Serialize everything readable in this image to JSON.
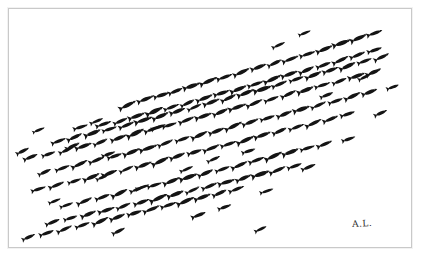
{
  "artwork": {
    "title": "School of Fish",
    "medium": "ink drawing",
    "signature": "A.L.",
    "background_color": "#ffffff",
    "ink_color": "#141414",
    "frame_color": "#c9c9c9",
    "canvas": {
      "width": 425,
      "height": 260
    },
    "frame": {
      "x": 8,
      "y": 8,
      "width": 404,
      "height": 240
    },
    "subject": "fish silhouettes swimming in diagonal rows toward upper right",
    "fish_count": 188,
    "row_angle_degrees": -22
  },
  "chart_data": {
    "type": "scatter",
    "title": "School of Fish",
    "xlabel": "",
    "ylabel": "",
    "xlim": [
      0,
      402
    ],
    "ylim": [
      0,
      238
    ],
    "grid": false,
    "legend": null,
    "marker": "fish-silhouette",
    "series": [
      {
        "name": "row-1",
        "points": [
          [
            119,
            96,
            16
          ],
          [
            137,
            90,
            15
          ],
          [
            153,
            86,
            14
          ],
          [
            167,
            82,
            13
          ],
          [
            183,
            77,
            15
          ],
          [
            200,
            72,
            16
          ],
          [
            216,
            68,
            14
          ],
          [
            233,
            63,
            15
          ],
          [
            250,
            58,
            14
          ],
          [
            266,
            54,
            13
          ],
          [
            282,
            50,
            15
          ],
          [
            299,
            45,
            14
          ],
          [
            316,
            40,
            15
          ],
          [
            333,
            34,
            16
          ],
          [
            350,
            29,
            15
          ],
          [
            366,
            24,
            14
          ]
        ]
      },
      {
        "name": "row-2",
        "points": [
          [
            95,
            115,
            14
          ],
          [
            112,
            112,
            13
          ],
          [
            128,
            107,
            15
          ],
          [
            146,
            102,
            16
          ],
          [
            163,
            98,
            14
          ],
          [
            179,
            94,
            13
          ],
          [
            196,
            89,
            15
          ],
          [
            213,
            84,
            14
          ],
          [
            230,
            80,
            15
          ],
          [
            247,
            75,
            14
          ],
          [
            264,
            70,
            16
          ],
          [
            281,
            65,
            15
          ],
          [
            298,
            61,
            14
          ],
          [
            315,
            56,
            13
          ],
          [
            332,
            51,
            15
          ],
          [
            349,
            46,
            14
          ],
          [
            366,
            41,
            13
          ]
        ]
      },
      {
        "name": "row-3",
        "points": [
          [
            50,
            132,
            13
          ],
          [
            66,
            128,
            14
          ],
          [
            84,
            124,
            15
          ],
          [
            101,
            120,
            13
          ],
          [
            118,
            116,
            14
          ],
          [
            135,
            111,
            16
          ],
          [
            152,
            107,
            15
          ],
          [
            169,
            102,
            14
          ],
          [
            186,
            98,
            13
          ],
          [
            203,
            93,
            15
          ],
          [
            220,
            89,
            14
          ],
          [
            237,
            84,
            15
          ],
          [
            254,
            80,
            16
          ],
          [
            271,
            75,
            14
          ],
          [
            288,
            70,
            13
          ],
          [
            305,
            66,
            15
          ],
          [
            322,
            61,
            14
          ],
          [
            339,
            57,
            15
          ],
          [
            356,
            52,
            13
          ],
          [
            373,
            48,
            14
          ]
        ]
      },
      {
        "name": "row-4",
        "points": [
          [
            22,
            148,
            13
          ],
          [
            40,
            145,
            12
          ],
          [
            58,
            141,
            14
          ],
          [
            75,
            137,
            15
          ],
          [
            92,
            133,
            13
          ],
          [
            110,
            129,
            14
          ],
          [
            127,
            124,
            16
          ],
          [
            144,
            120,
            15
          ],
          [
            161,
            116,
            13
          ],
          [
            178,
            111,
            14
          ],
          [
            195,
            107,
            15
          ],
          [
            212,
            103,
            14
          ],
          [
            229,
            98,
            16
          ],
          [
            246,
            94,
            15
          ],
          [
            263,
            90,
            13
          ],
          [
            280,
            85,
            14
          ],
          [
            297,
            81,
            15
          ],
          [
            314,
            76,
            14
          ],
          [
            331,
            72,
            13
          ],
          [
            348,
            67,
            15
          ],
          [
            365,
            63,
            14
          ]
        ]
      },
      {
        "name": "row-5",
        "points": [
          [
            36,
            163,
            12
          ],
          [
            54,
            159,
            13
          ],
          [
            71,
            155,
            15
          ],
          [
            88,
            151,
            14
          ],
          [
            106,
            147,
            13
          ],
          [
            123,
            143,
            15
          ],
          [
            140,
            139,
            16
          ],
          [
            157,
            134,
            14
          ],
          [
            174,
            130,
            13
          ],
          [
            191,
            126,
            15
          ],
          [
            208,
            122,
            14
          ],
          [
            225,
            117,
            16
          ],
          [
            242,
            113,
            15
          ],
          [
            259,
            109,
            13
          ],
          [
            276,
            105,
            14
          ],
          [
            293,
            100,
            15
          ],
          [
            310,
            96,
            14
          ],
          [
            327,
            92,
            13
          ],
          [
            344,
            87,
            15
          ],
          [
            361,
            83,
            14
          ]
        ]
      },
      {
        "name": "row-6",
        "points": [
          [
            30,
            180,
            13
          ],
          [
            48,
            176,
            14
          ],
          [
            66,
            172,
            12
          ],
          [
            83,
            168,
            15
          ],
          [
            101,
            164,
            14
          ],
          [
            118,
            160,
            13
          ],
          [
            135,
            156,
            15
          ],
          [
            152,
            152,
            16
          ],
          [
            169,
            147,
            14
          ],
          [
            186,
            143,
            13
          ],
          [
            203,
            139,
            15
          ],
          [
            220,
            135,
            14
          ],
          [
            237,
            131,
            16
          ],
          [
            254,
            126,
            15
          ],
          [
            271,
            122,
            13
          ],
          [
            288,
            118,
            14
          ],
          [
            305,
            114,
            15
          ],
          [
            322,
            110,
            14
          ],
          [
            339,
            105,
            13
          ]
        ]
      },
      {
        "name": "row-7",
        "points": [
          [
            58,
            196,
            12
          ],
          [
            76,
            192,
            14
          ],
          [
            94,
            188,
            13
          ],
          [
            111,
            184,
            15
          ],
          [
            129,
            180,
            14
          ],
          [
            146,
            176,
            13
          ],
          [
            163,
            172,
            15
          ],
          [
            180,
            168,
            16
          ],
          [
            197,
            164,
            14
          ],
          [
            214,
            160,
            13
          ],
          [
            231,
            156,
            15
          ],
          [
            248,
            151,
            14
          ],
          [
            265,
            147,
            16
          ],
          [
            282,
            143,
            15
          ],
          [
            299,
            139,
            13
          ],
          [
            316,
            135,
            14
          ]
        ]
      },
      {
        "name": "row-8",
        "points": [
          [
            44,
            213,
            13
          ],
          [
            62,
            209,
            12
          ],
          [
            80,
            205,
            14
          ],
          [
            98,
            201,
            15
          ],
          [
            115,
            197,
            13
          ],
          [
            133,
            193,
            14
          ],
          [
            150,
            189,
            16
          ],
          [
            167,
            185,
            15
          ],
          [
            184,
            181,
            13
          ],
          [
            201,
            177,
            14
          ],
          [
            218,
            173,
            15
          ],
          [
            235,
            169,
            14
          ],
          [
            252,
            165,
            16
          ],
          [
            269,
            161,
            15
          ],
          [
            286,
            157,
            13
          ]
        ]
      },
      {
        "name": "row-9",
        "points": [
          [
            20,
            228,
            12
          ],
          [
            38,
            224,
            13
          ],
          [
            56,
            220,
            14
          ],
          [
            74,
            216,
            13
          ],
          [
            92,
            212,
            15
          ],
          [
            109,
            208,
            14
          ],
          [
            126,
            204,
            13
          ],
          [
            143,
            200,
            15
          ],
          [
            160,
            196,
            14
          ],
          [
            177,
            192,
            16
          ],
          [
            194,
            188,
            15
          ],
          [
            211,
            184,
            13
          ],
          [
            228,
            180,
            14
          ]
        ]
      },
      {
        "name": "strays",
        "points": [
          [
            14,
            142,
            12
          ],
          [
            30,
            121,
            11
          ],
          [
            72,
            118,
            13
          ],
          [
            88,
            112,
            12
          ],
          [
            100,
            145,
            12
          ],
          [
            64,
            137,
            13
          ],
          [
            150,
            118,
            13
          ],
          [
            205,
            150,
            12
          ],
          [
            46,
            192,
            11
          ],
          [
            110,
            222,
            12
          ],
          [
            190,
            206,
            13
          ],
          [
            258,
            182,
            12
          ],
          [
            300,
            158,
            13
          ],
          [
            340,
            130,
            12
          ],
          [
            372,
            104,
            12
          ],
          [
            384,
            78,
            11
          ],
          [
            270,
            36,
            12
          ],
          [
            296,
            24,
            11
          ],
          [
            356,
            68,
            12
          ],
          [
            318,
            86,
            12
          ],
          [
            240,
            142,
            12
          ],
          [
            178,
            160,
            12
          ],
          [
            134,
            178,
            12
          ],
          [
            94,
            168,
            12
          ],
          [
            216,
            198,
            12
          ],
          [
            252,
            220,
            11
          ]
        ]
      }
    ]
  },
  "signature_block": {
    "text": "A.L.",
    "position": "bottom-right"
  }
}
